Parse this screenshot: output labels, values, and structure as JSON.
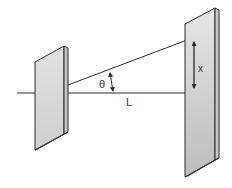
{
  "diagram": {
    "labels": {
      "theta": "θ",
      "distance": "L",
      "displacement": "x"
    },
    "colors": {
      "stroke": "#2a2a2a",
      "plate_face": "#d6d6d6",
      "plate_edge": "#bdbdbd",
      "background": "#ffffff"
    }
  }
}
